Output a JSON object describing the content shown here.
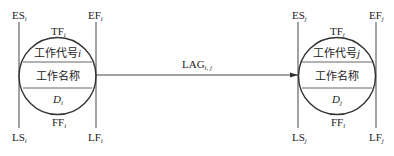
{
  "diagram": {
    "type": "single-code precedence network node pair (activity-on-node)",
    "node_i": {
      "corner_labels": {
        "top_left": {
          "base": "ES",
          "sub": "i"
        },
        "top_right": {
          "base": "EF",
          "sub": "i"
        },
        "bottom_left": {
          "base": "LS",
          "sub": "i"
        },
        "bottom_right": {
          "base": "LF",
          "sub": "i"
        }
      },
      "top_label": {
        "base": "TF",
        "sub": "i"
      },
      "bottom_label": {
        "base": "FF",
        "sub": "i"
      },
      "code_text": "工作代号",
      "code_var": "i",
      "name_text": "工作名称",
      "duration": {
        "base": "D",
        "sub": "i"
      }
    },
    "node_j": {
      "corner_labels": {
        "top_left": {
          "base": "ES",
          "sub": "j"
        },
        "top_right": {
          "base": "EF",
          "sub": "j"
        },
        "bottom_left": {
          "base": "LS",
          "sub": "j"
        },
        "bottom_right": {
          "base": "LF",
          "sub": "j"
        }
      },
      "top_label": {
        "base": "TF",
        "sub": "j"
      },
      "bottom_label": {
        "base": "FF",
        "sub": "i"
      },
      "code_text": "工作代号",
      "code_var": "j",
      "name_text": "工作名称",
      "duration": {
        "base": "D",
        "sub": "j"
      }
    },
    "link": {
      "label": {
        "base": "LAG",
        "sub": "i, j"
      },
      "from": "node_i",
      "to": "node_j",
      "arrow": "arrow-right"
    },
    "colors": {
      "stroke": "#333333",
      "text": "#222222",
      "background": "#ffffff"
    }
  }
}
